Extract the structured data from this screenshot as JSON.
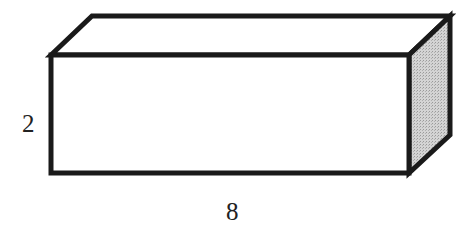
{
  "diagram": {
    "type": "rectangular-prism",
    "labels": {
      "height": "2",
      "length": "8"
    },
    "colors": {
      "stroke": "#1a1a1a",
      "front_face": "#ffffff",
      "top_face": "#ffffff",
      "side_face": "#c8c8c8",
      "background": "#ffffff"
    },
    "geometry": {
      "front_face": {
        "x1": 51,
        "y1": 55,
        "x2": 409,
        "y2": 173
      },
      "depth_offset": {
        "dx": 41,
        "dy": -39
      }
    }
  }
}
